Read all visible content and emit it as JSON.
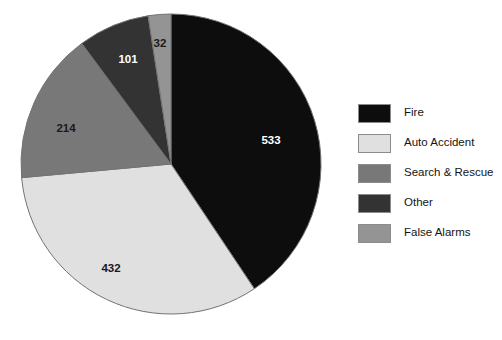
{
  "chart_data": {
    "type": "pie",
    "title": "",
    "subtitle": "",
    "xlabel": "",
    "ylabel": "",
    "legend_position": "right",
    "grid": false,
    "total": 1312,
    "categories": [
      "Fire",
      "Auto Accident",
      "Search & Rescue",
      "Other",
      "False Alarms"
    ],
    "values": [
      533,
      432,
      214,
      101,
      32
    ],
    "value_labels": [
      "533",
      "432",
      "214",
      "101",
      "32"
    ],
    "colors": [
      "#0d0d0d",
      "#e0e0e0",
      "#787878",
      "#333333",
      "#949494"
    ],
    "label_text_colors": [
      "#ffffff",
      "#1a1a1a",
      "#1a1a1a",
      "#ffffff",
      "#1a1a1a"
    ],
    "slices": [
      {
        "name": "Fire",
        "value": 533,
        "label": "533",
        "color": "#0d0d0d",
        "label_color": "#ffffff"
      },
      {
        "name": "Auto Accident",
        "value": 432,
        "label": "432",
        "color": "#e0e0e0",
        "label_color": "#1a1a1a"
      },
      {
        "name": "Search & Rescue",
        "value": 214,
        "label": "214",
        "color": "#787878",
        "label_color": "#1a1a1a"
      },
      {
        "name": "Other",
        "value": 101,
        "label": "101",
        "color": "#333333",
        "label_color": "#ffffff"
      },
      {
        "name": "False Alarms",
        "value": 32,
        "label": "32",
        "color": "#949494",
        "label_color": "#1a1a1a"
      }
    ]
  },
  "pie": {
    "center_x": 171,
    "center_y": 164,
    "radius": 150,
    "start_angle_deg": 0,
    "direction": "clockwise",
    "outline_color": "#737373",
    "labels": [
      {
        "text": "533",
        "x": 271,
        "y": 141,
        "color": "#ffffff"
      },
      {
        "text": "432",
        "x": 111,
        "y": 269,
        "color": "#1a1a1a"
      },
      {
        "text": "214",
        "x": 66,
        "y": 129,
        "color": "#1a1a1a"
      },
      {
        "text": "101",
        "x": 128,
        "y": 60,
        "color": "#ffffff"
      },
      {
        "text": "32",
        "x": 160,
        "y": 44,
        "color": "#1a1a1a"
      }
    ]
  },
  "legend": {
    "items": [
      {
        "label": "Fire",
        "color": "#0d0d0d"
      },
      {
        "label": "Auto Accident",
        "color": "#e0e0e0"
      },
      {
        "label": "Search & Rescue",
        "color": "#787878"
      },
      {
        "label": "Other",
        "color": "#333333"
      },
      {
        "label": "False Alarms",
        "color": "#949494"
      }
    ]
  }
}
